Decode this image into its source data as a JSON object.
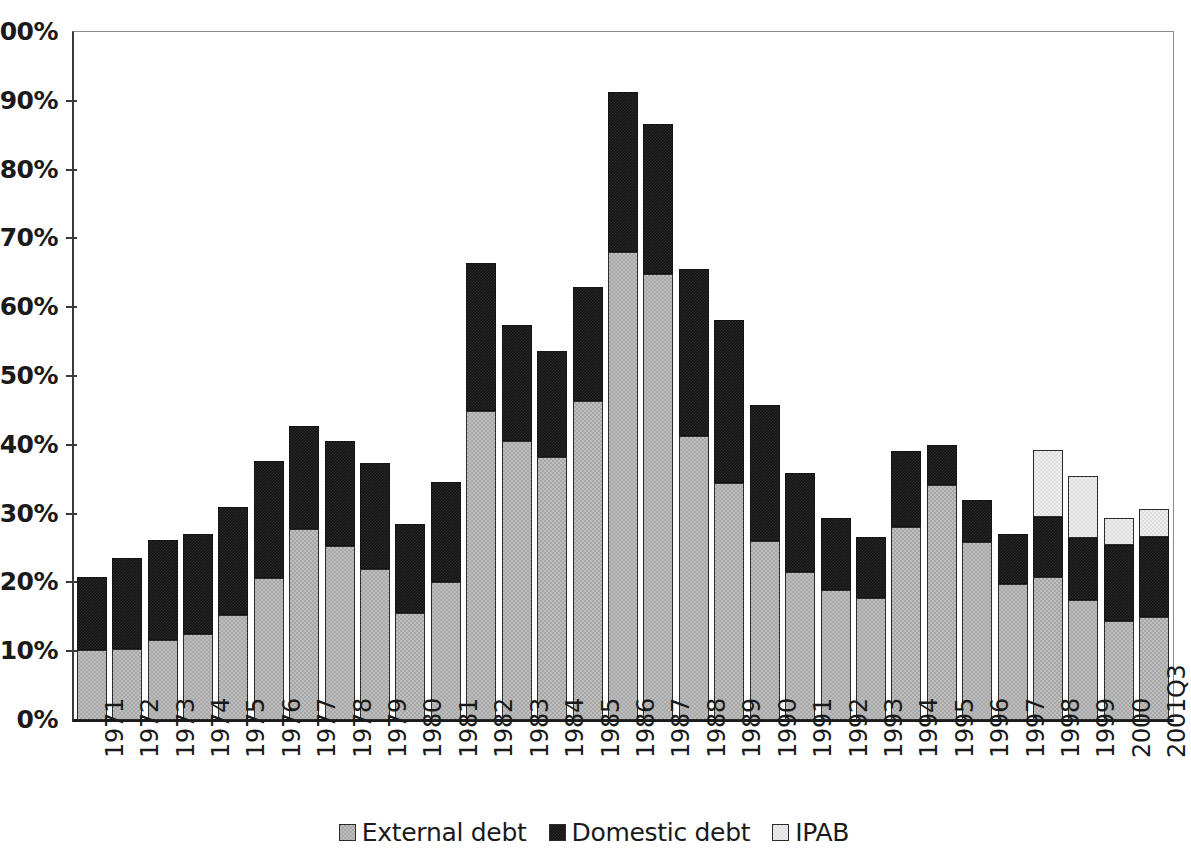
{
  "chart_data": {
    "type": "bar",
    "subtype": "stacked",
    "title": "",
    "subtitle": "",
    "xlabel": "",
    "ylabel": "",
    "ylim": [
      0,
      100
    ],
    "y_unit": "%",
    "grid": false,
    "legend_position": "bottom",
    "y_ticks": [
      "0%",
      "10%",
      "20%",
      "30%",
      "40%",
      "50%",
      "60%",
      "70%",
      "80%",
      "90%",
      "100%"
    ],
    "y_tick_values": [
      0,
      10,
      20,
      30,
      40,
      50,
      60,
      70,
      80,
      90,
      100
    ],
    "categories": [
      "1971",
      "1972",
      "1973",
      "1974",
      "1975",
      "1976",
      "1977",
      "1978",
      "1979",
      "1980",
      "1981",
      "1982",
      "1983",
      "1984",
      "1985",
      "1986",
      "1987",
      "1988",
      "1989",
      "1990",
      "1991",
      "1992",
      "1993",
      "1994",
      "1995",
      "1996",
      "1997",
      "1998",
      "1999",
      "2000",
      "2001Q3"
    ],
    "series": [
      {
        "name": "External debt",
        "color": "#a8a8a8",
        "values": [
          10.2,
          10.3,
          11.7,
          12.5,
          15.2,
          20.6,
          27.8,
          25.3,
          22.0,
          15.6,
          20.1,
          44.9,
          40.5,
          38.3,
          46.3,
          68.0,
          64.9,
          41.3,
          34.5,
          26.0,
          21.5,
          18.9,
          17.7,
          28.0,
          34.1,
          25.9,
          19.7,
          20.8,
          17.4,
          14.4,
          15.0
        ]
      },
      {
        "name": "Domestic debt",
        "color": "#141414",
        "values": [
          10.6,
          13.3,
          14.4,
          14.6,
          15.7,
          17.1,
          14.9,
          15.2,
          15.4,
          12.9,
          14.5,
          21.6,
          16.9,
          15.4,
          16.6,
          23.3,
          21.7,
          24.3,
          23.6,
          19.8,
          14.4,
          10.4,
          8.9,
          11.1,
          5.9,
          6.1,
          7.4,
          8.7,
          9.1,
          11.0,
          11.6
        ]
      },
      {
        "name": "IPAB",
        "color": "#dedede",
        "values": [
          0,
          0,
          0,
          0,
          0,
          0,
          0,
          0,
          0,
          0,
          0,
          0,
          0,
          0,
          0,
          0,
          0,
          0,
          0,
          0,
          0,
          0,
          0,
          0,
          0,
          0,
          0,
          9.8,
          8.9,
          4.0,
          4.0
        ]
      }
    ],
    "totals": [
      20.8,
      23.6,
      26.1,
      27.1,
      30.9,
      37.7,
      42.7,
      40.5,
      37.4,
      28.5,
      34.6,
      66.5,
      57.4,
      53.7,
      62.9,
      91.3,
      86.6,
      65.6,
      58.1,
      45.8,
      35.9,
      29.3,
      26.6,
      39.1,
      40.0,
      32.0,
      27.1,
      39.3,
      35.4,
      29.4,
      30.6
    ]
  },
  "legend": {
    "items": [
      {
        "label": "External debt",
        "swatch": "external-debt-swatch"
      },
      {
        "label": "Domestic debt",
        "swatch": "domestic-debt-swatch"
      },
      {
        "label": "IPAB",
        "swatch": "ipab-swatch"
      }
    ]
  }
}
